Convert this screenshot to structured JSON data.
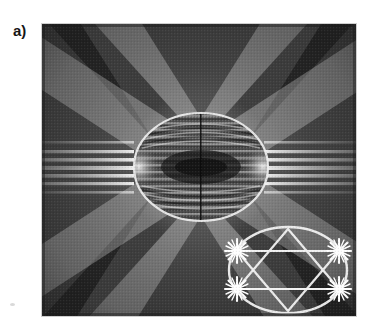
{
  "figure": {
    "panel_label": "a)",
    "caption_text": "",
    "image_kind": "electron-diffraction-pattern",
    "frame": {
      "x": 42,
      "y": 24,
      "width": 314,
      "height": 292
    },
    "background_color": "#2a2a2a"
  },
  "colors": {
    "page_background": "#ffffff",
    "label_text": "#161616",
    "plate_dark": "#1d1d1d",
    "plate_mid": "#4a4a4a",
    "plate_light": "#9b9b9b",
    "plate_bright": "#e8e8e8",
    "overlay_line": "#f2f2f2",
    "star_marker": "#ffffff"
  },
  "pattern": {
    "type": "radial-fringe-diffraction",
    "center": {
      "x": 201,
      "y": 167
    },
    "central_ellipse": {
      "cx": 201,
      "cy": 167,
      "rx": 67,
      "ry": 54,
      "stroke": "#f0f0f0"
    },
    "radial_ray_count": 120,
    "horizontal_lobe_count": 9,
    "mirror_symmetry": "left-right and top-bottom",
    "diagonal_band_angles_deg": [
      -62,
      -38,
      38,
      62,
      118,
      142,
      218,
      242
    ],
    "fringe_spacing_px": 3
  },
  "inset": {
    "name": "reciprocal-lattice-schematic",
    "ellipse": {
      "cx": 288,
      "cy": 270,
      "rx": 59,
      "ry": 43,
      "stroke": "#f2f2f2"
    },
    "stars": [
      {
        "id": "star-top-left",
        "x": 237,
        "y": 251,
        "radius": 11,
        "points": 9
      },
      {
        "id": "star-top-right",
        "x": 338,
        "y": 251,
        "radius": 11,
        "points": 9
      },
      {
        "id": "star-bottom-left",
        "x": 237,
        "y": 289,
        "radius": 11,
        "points": 9
      },
      {
        "id": "star-bottom-right",
        "x": 338,
        "y": 289,
        "radius": 11,
        "points": 9
      }
    ],
    "triangle_up": [
      {
        "x": 288,
        "y": 229
      },
      {
        "x": 237,
        "y": 289
      },
      {
        "x": 338,
        "y": 289
      }
    ],
    "triangle_down": [
      {
        "x": 288,
        "y": 311
      },
      {
        "x": 237,
        "y": 251
      },
      {
        "x": 338,
        "y": 251
      }
    ],
    "chords": [
      {
        "id": "upper-chord",
        "x1": 237,
        "y1": 251,
        "x2": 338,
        "y2": 251
      },
      {
        "id": "lower-chord",
        "x1": 237,
        "y1": 289,
        "x2": 338,
        "y2": 289
      }
    ]
  }
}
